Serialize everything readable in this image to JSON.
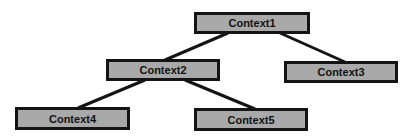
{
  "diagram": {
    "type": "tree",
    "nodes": [
      {
        "id": "c1",
        "label": "Context1"
      },
      {
        "id": "c2",
        "label": "Context2"
      },
      {
        "id": "c3",
        "label": "Context3"
      },
      {
        "id": "c4",
        "label": "Context4"
      },
      {
        "id": "c5",
        "label": "Context5"
      }
    ],
    "edges": [
      {
        "from": "Context1",
        "to": "Context2"
      },
      {
        "from": "Context1",
        "to": "Context3"
      },
      {
        "from": "Context2",
        "to": "Context4"
      },
      {
        "from": "Context2",
        "to": "Context5"
      }
    ],
    "colors": {
      "node_fill": "#a9a9a9",
      "border": "#141414",
      "edge": "#141414"
    }
  }
}
